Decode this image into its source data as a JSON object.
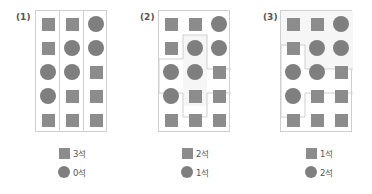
{
  "colors": {
    "shape": "#8c8c8c",
    "border": "#cfcfcf",
    "region_fill": "#f6f6f6"
  },
  "panels": [
    {
      "label": "(1)",
      "grid": [
        [
          "square",
          "square",
          "circle"
        ],
        [
          "square",
          "circle",
          "circle"
        ],
        [
          "circle",
          "circle",
          "square"
        ],
        [
          "circle",
          "square",
          "square"
        ],
        [
          "square",
          "square",
          "square"
        ]
      ],
      "partition": "3 vertical columns",
      "legend": [
        {
          "shape": "square",
          "text": "3석"
        },
        {
          "shape": "circle",
          "text": "0석"
        }
      ]
    },
    {
      "label": "(2)",
      "grid": [
        [
          "square",
          "square",
          "circle"
        ],
        [
          "square",
          "circle",
          "circle"
        ],
        [
          "circle",
          "circle",
          "square"
        ],
        [
          "circle",
          "square",
          "square"
        ],
        [
          "square",
          "square",
          "square"
        ]
      ],
      "partition": "3 regions: top-left L, center plus-shaped, right/bottom region",
      "legend": [
        {
          "shape": "square",
          "text": "2석"
        },
        {
          "shape": "circle",
          "text": "1석"
        }
      ]
    },
    {
      "label": "(3)",
      "grid": [
        [
          "square",
          "square",
          "circle"
        ],
        [
          "square",
          "circle",
          "circle"
        ],
        [
          "circle",
          "circle",
          "square"
        ],
        [
          "circle",
          "square",
          "square"
        ],
        [
          "square",
          "square",
          "square"
        ]
      ],
      "partition": "3 regions: top, left-middle, bottom-right",
      "legend": [
        {
          "shape": "square",
          "text": "1석"
        },
        {
          "shape": "circle",
          "text": "2석"
        }
      ]
    }
  ]
}
